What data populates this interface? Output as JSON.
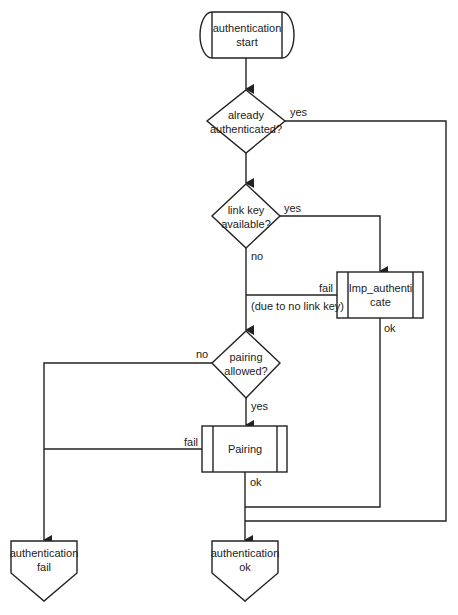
{
  "diagram": {
    "type": "flowchart",
    "line_color": "#222222",
    "background": "#ffffff",
    "nodes": {
      "start": {
        "shape": "terminator",
        "line1": "authentication",
        "line2": "start"
      },
      "already_auth": {
        "shape": "decision",
        "line1": "already",
        "line2": "authenticated?"
      },
      "link_key": {
        "shape": "decision",
        "line1": "link key",
        "line2": "available?"
      },
      "imp_auth": {
        "shape": "predefined-process",
        "line1": "Imp_authenti",
        "line2": "cate"
      },
      "pairing_allowed": {
        "shape": "decision",
        "line1": "pairing",
        "line2": "allowed?"
      },
      "pairing": {
        "shape": "predefined-process",
        "line1": "Pairing"
      },
      "auth_fail": {
        "shape": "off-page-connector",
        "line1": "authentication",
        "line2": "fail"
      },
      "auth_ok": {
        "shape": "off-page-connector",
        "line1": "authentication",
        "line2": "ok"
      }
    },
    "edge_labels": {
      "already_yes": "yes",
      "link_yes": "yes",
      "link_no": "no",
      "imp_fail": "fail",
      "imp_fail_note": "(due to no link key)",
      "imp_ok": "ok",
      "pairing_no": "no",
      "pairing_yes": "yes",
      "pairing_fail": "fail",
      "pairing_ok": "ok"
    }
  }
}
